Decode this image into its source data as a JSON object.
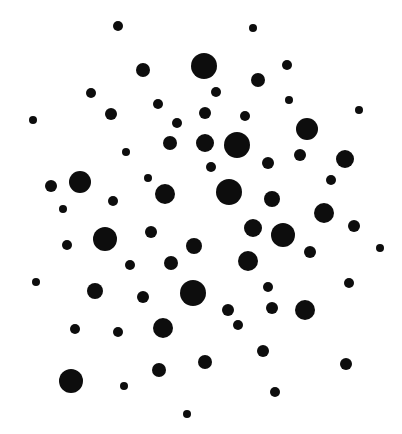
{
  "canvas": {
    "width": 402,
    "height": 434,
    "background_color": "#ffffff",
    "dot_color": "#0d0d0d"
  },
  "chart_data": {
    "type": "scatter",
    "title": "",
    "subtitle": "",
    "xlabel": "",
    "ylabel": "",
    "xlim": [
      0,
      402
    ],
    "ylim": [
      0,
      434
    ],
    "grid": false,
    "axes_visible": false,
    "tick_labels_visible": false,
    "legend": null,
    "annotations": [],
    "marker": "circle",
    "marker_color": "#0d0d0d",
    "point_count": 68,
    "radius_range": [
      3,
      13
    ],
    "columns": [
      "cx",
      "cy",
      "r"
    ],
    "points": [
      {
        "cx": 118,
        "cy": 26,
        "r": 5
      },
      {
        "cx": 253,
        "cy": 28,
        "r": 4
      },
      {
        "cx": 143,
        "cy": 70,
        "r": 7
      },
      {
        "cx": 204,
        "cy": 66,
        "r": 13
      },
      {
        "cx": 258,
        "cy": 80,
        "r": 7
      },
      {
        "cx": 287,
        "cy": 65,
        "r": 5
      },
      {
        "cx": 91,
        "cy": 93,
        "r": 5
      },
      {
        "cx": 359,
        "cy": 110,
        "r": 4
      },
      {
        "cx": 33,
        "cy": 120,
        "r": 4
      },
      {
        "cx": 111,
        "cy": 114,
        "r": 6
      },
      {
        "cx": 158,
        "cy": 104,
        "r": 5
      },
      {
        "cx": 205,
        "cy": 113,
        "r": 6
      },
      {
        "cx": 245,
        "cy": 116,
        "r": 5
      },
      {
        "cx": 307,
        "cy": 129,
        "r": 11
      },
      {
        "cx": 126,
        "cy": 152,
        "r": 4
      },
      {
        "cx": 170,
        "cy": 143,
        "r": 7
      },
      {
        "cx": 205,
        "cy": 143,
        "r": 9
      },
      {
        "cx": 237,
        "cy": 145,
        "r": 13
      },
      {
        "cx": 268,
        "cy": 163,
        "r": 6
      },
      {
        "cx": 300,
        "cy": 155,
        "r": 6
      },
      {
        "cx": 345,
        "cy": 159,
        "r": 9
      },
      {
        "cx": 51,
        "cy": 186,
        "r": 6
      },
      {
        "cx": 80,
        "cy": 182,
        "r": 11
      },
      {
        "cx": 113,
        "cy": 201,
        "r": 5
      },
      {
        "cx": 165,
        "cy": 194,
        "r": 10
      },
      {
        "cx": 229,
        "cy": 192,
        "r": 13
      },
      {
        "cx": 272,
        "cy": 199,
        "r": 8
      },
      {
        "cx": 324,
        "cy": 213,
        "r": 10
      },
      {
        "cx": 354,
        "cy": 226,
        "r": 6
      },
      {
        "cx": 67,
        "cy": 245,
        "r": 5
      },
      {
        "cx": 105,
        "cy": 239,
        "r": 12
      },
      {
        "cx": 151,
        "cy": 232,
        "r": 6
      },
      {
        "cx": 194,
        "cy": 246,
        "r": 8
      },
      {
        "cx": 253,
        "cy": 228,
        "r": 9
      },
      {
        "cx": 283,
        "cy": 235,
        "r": 12
      },
      {
        "cx": 310,
        "cy": 252,
        "r": 6
      },
      {
        "cx": 380,
        "cy": 248,
        "r": 4
      },
      {
        "cx": 130,
        "cy": 265,
        "r": 5
      },
      {
        "cx": 171,
        "cy": 263,
        "r": 7
      },
      {
        "cx": 248,
        "cy": 261,
        "r": 10
      },
      {
        "cx": 349,
        "cy": 283,
        "r": 5
      },
      {
        "cx": 36,
        "cy": 282,
        "r": 4
      },
      {
        "cx": 95,
        "cy": 291,
        "r": 8
      },
      {
        "cx": 143,
        "cy": 297,
        "r": 6
      },
      {
        "cx": 193,
        "cy": 293,
        "r": 13
      },
      {
        "cx": 228,
        "cy": 310,
        "r": 6
      },
      {
        "cx": 268,
        "cy": 287,
        "r": 5
      },
      {
        "cx": 305,
        "cy": 310,
        "r": 10
      },
      {
        "cx": 75,
        "cy": 329,
        "r": 5
      },
      {
        "cx": 118,
        "cy": 332,
        "r": 5
      },
      {
        "cx": 163,
        "cy": 328,
        "r": 10
      },
      {
        "cx": 238,
        "cy": 325,
        "r": 5
      },
      {
        "cx": 272,
        "cy": 308,
        "r": 6
      },
      {
        "cx": 205,
        "cy": 362,
        "r": 7
      },
      {
        "cx": 263,
        "cy": 351,
        "r": 6
      },
      {
        "cx": 71,
        "cy": 381,
        "r": 12
      },
      {
        "cx": 124,
        "cy": 386,
        "r": 4
      },
      {
        "cx": 159,
        "cy": 370,
        "r": 7
      },
      {
        "cx": 275,
        "cy": 392,
        "r": 5
      },
      {
        "cx": 346,
        "cy": 364,
        "r": 6
      },
      {
        "cx": 187,
        "cy": 414,
        "r": 4
      },
      {
        "cx": 148,
        "cy": 178,
        "r": 4
      },
      {
        "cx": 216,
        "cy": 92,
        "r": 5
      },
      {
        "cx": 63,
        "cy": 209,
        "r": 4
      },
      {
        "cx": 289,
        "cy": 100,
        "r": 4
      },
      {
        "cx": 331,
        "cy": 180,
        "r": 5
      },
      {
        "cx": 211,
        "cy": 167,
        "r": 5
      },
      {
        "cx": 177,
        "cy": 123,
        "r": 5
      }
    ]
  }
}
